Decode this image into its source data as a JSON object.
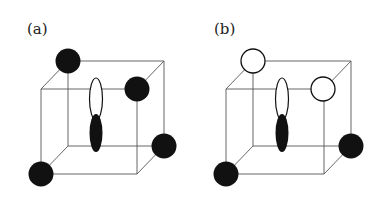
{
  "figure": {
    "panels": [
      {
        "label": "(a)",
        "corner_atoms": [
          {
            "position": "back-top-left",
            "fill": "#111111"
          },
          {
            "position": "front-top-right",
            "fill": "#111111"
          },
          {
            "position": "back-bottom-right",
            "fill": "#111111"
          },
          {
            "position": "front-bottom-left",
            "fill": "#111111"
          }
        ],
        "orbital": {
          "upper_lobe": "#ffffff",
          "lower_lobe": "#111111"
        }
      },
      {
        "label": "(b)",
        "corner_atoms": [
          {
            "position": "back-top-left",
            "fill": "#ffffff"
          },
          {
            "position": "front-top-right",
            "fill": "#ffffff"
          },
          {
            "position": "back-bottom-right",
            "fill": "#111111"
          },
          {
            "position": "front-bottom-left",
            "fill": "#111111"
          }
        ],
        "orbital": {
          "upper_lobe": "#ffffff",
          "lower_lobe": "#111111"
        }
      }
    ]
  }
}
